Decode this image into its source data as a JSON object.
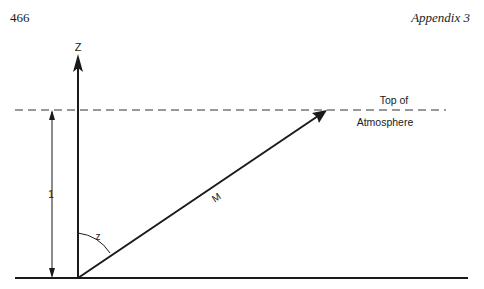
{
  "header": {
    "page_number": "466",
    "running_head": "Appendix 3"
  },
  "diagram": {
    "axis_label": "Z",
    "top_label_line1": "Top of",
    "top_label_line2": "Atmosphere",
    "height_label": "1",
    "angle_label": "z",
    "path_label": "M",
    "line_color": "#1a1a1a"
  }
}
